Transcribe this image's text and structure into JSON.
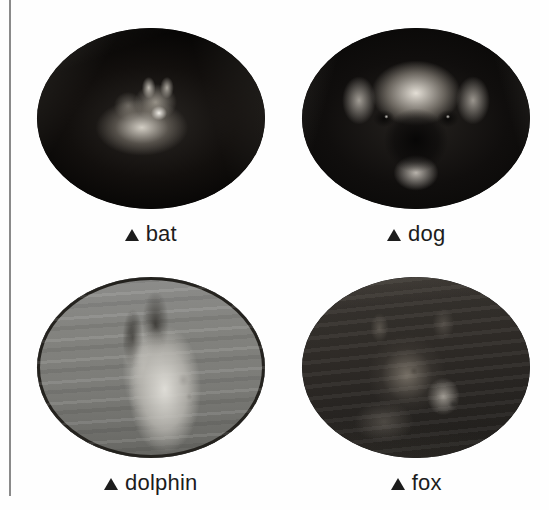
{
  "page": {
    "background_color": "#fefefe",
    "width": 549,
    "height": 510,
    "margin_rule_color": "#8a8a8a"
  },
  "caption_style": {
    "text_color": "#1c1c1c",
    "bullet_glyph": "triangle-up",
    "bullet_color": "#1c1c1c"
  },
  "figures": [
    {
      "id": "bat",
      "label": "bat",
      "bullet": "▲",
      "shape": "ellipse",
      "position": "top-left",
      "tone": "very-dark",
      "has_outline": false,
      "dominant_color": "#0b0a09"
    },
    {
      "id": "dog",
      "label": "dog",
      "bullet": "▲",
      "shape": "ellipse",
      "position": "top-right",
      "tone": "dark",
      "has_outline": false,
      "dominant_color": "#100e0d"
    },
    {
      "id": "dolphin",
      "label": "dolphin",
      "bullet": "▲",
      "shape": "ellipse",
      "position": "bottom-left",
      "tone": "mid-gray",
      "has_outline": true,
      "outline_color": "#25231f",
      "dominant_color": "#7c7c78"
    },
    {
      "id": "fox",
      "label": "fox",
      "bullet": "▲",
      "shape": "ellipse",
      "position": "bottom-right",
      "tone": "dark-gray",
      "has_outline": false,
      "dominant_color": "#2f2c28"
    }
  ]
}
